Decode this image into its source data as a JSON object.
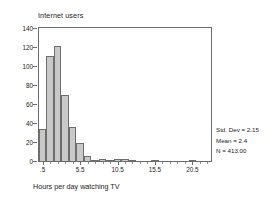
{
  "chart_data": {
    "type": "bar",
    "title": "Internet users",
    "xlabel": "Hours per day watching TV",
    "ylabel": "Frequency",
    "ylim": [
      0,
      140
    ],
    "yticks": [
      0,
      20,
      40,
      60,
      80,
      100,
      120,
      140
    ],
    "xlim": [
      0,
      23
    ],
    "xticks": [
      0.5,
      5.5,
      10.5,
      15.5,
      20.5
    ],
    "xtick_labels": [
      ".5",
      "5.5",
      "10.5",
      "15.5",
      "20.5"
    ],
    "grid": false,
    "legend": "none",
    "bin_width": 1,
    "bin_centers": [
      0.5,
      1.5,
      2.5,
      3.5,
      4.5,
      5.5,
      6.5,
      7.5,
      8.5,
      9.5,
      10.5,
      11.5,
      12.5,
      13.5,
      14.5,
      15.5,
      16.5,
      17.5,
      18.5,
      19.5,
      20.5,
      21.5
    ],
    "values": [
      34,
      111,
      121,
      69,
      36,
      19,
      5,
      1,
      2,
      1,
      2,
      2,
      1,
      0,
      0,
      1,
      0,
      0,
      0,
      0,
      1,
      0
    ],
    "annotations": [
      "Std. Dev = 2.15",
      "Mean = 2.4",
      "N = 413.00"
    ]
  },
  "stats": {
    "std_dev": "Std. Dev = 2.15",
    "mean": "Mean = 2.4",
    "n": "N = 413.00"
  },
  "colors": {
    "bar_fill": "#c9c9c9",
    "bar_edge": "#6e6e6e",
    "axis": "#6b6b6b",
    "text": "#222222",
    "background": "#ffffff"
  }
}
